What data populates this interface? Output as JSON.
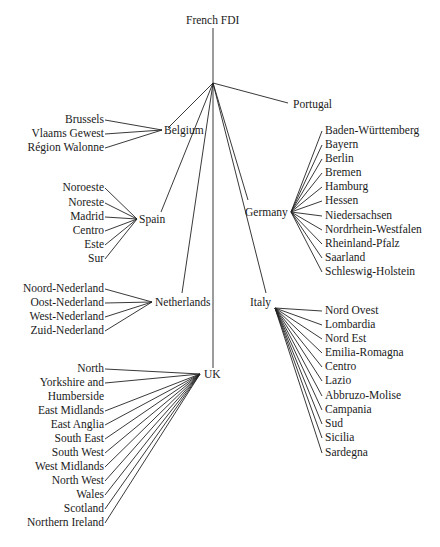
{
  "root": {
    "label": "French FDI",
    "x": 213,
    "y": 20
  },
  "hub": {
    "x": 213,
    "y": 83
  },
  "countries": [
    {
      "label": "Belgium",
      "x": 162,
      "y": 130,
      "anchor": "left",
      "tx": 164,
      "ty": 124,
      "regions_side": "left",
      "regions": [
        {
          "label": "Brussels",
          "x": 105,
          "y": 120
        },
        {
          "label": "Vlaams Gewest",
          "x": 105,
          "y": 134
        },
        {
          "label": "Région Walonne",
          "x": 105,
          "y": 148
        }
      ]
    },
    {
      "label": "Spain",
      "x": 137,
      "y": 219,
      "anchor": "left",
      "tx": 139,
      "ty": 213,
      "regions_side": "left",
      "regions": [
        {
          "label": "Noroeste",
          "x": 105,
          "y": 188
        },
        {
          "label": "Noreste",
          "x": 105,
          "y": 203
        },
        {
          "label": "Madrid",
          "x": 105,
          "y": 217
        },
        {
          "label": "Centro",
          "x": 105,
          "y": 231
        },
        {
          "label": "Este",
          "x": 105,
          "y": 245
        },
        {
          "label": "Sur",
          "x": 105,
          "y": 259
        }
      ]
    },
    {
      "label": "Netherlands",
      "x": 152,
      "y": 302,
      "anchor": "left",
      "tx": 155,
      "ty": 296,
      "regions_side": "left",
      "regions": [
        {
          "label": "Noord-Nederland",
          "x": 105,
          "y": 289
        },
        {
          "label": "Oost-Nederland",
          "x": 105,
          "y": 303
        },
        {
          "label": "West-Nederland",
          "x": 105,
          "y": 317
        },
        {
          "label": "Zuid-Nederland",
          "x": 105,
          "y": 331
        }
      ]
    },
    {
      "label": "UK",
      "x": 200,
      "y": 374,
      "anchor": "left",
      "tx": 204,
      "ty": 368,
      "regions_side": "left",
      "regions": [
        {
          "label": "North",
          "x": 105,
          "y": 369
        },
        {
          "label": "Yorkshire and",
          "x": 105,
          "y": 383
        },
        {
          "label": "Humberside",
          "x": null,
          "y": 397
        },
        {
          "label": "East Midlands",
          "x": 105,
          "y": 411
        },
        {
          "label": "East Anglia",
          "x": 105,
          "y": 425
        },
        {
          "label": "South East",
          "x": 105,
          "y": 439
        },
        {
          "label": "South West",
          "x": 105,
          "y": 453
        },
        {
          "label": "West Midlands",
          "x": 105,
          "y": 467
        },
        {
          "label": "North West",
          "x": 105,
          "y": 481
        },
        {
          "label": "Wales",
          "x": 105,
          "y": 495
        },
        {
          "label": "Scotland",
          "x": 105,
          "y": 509
        },
        {
          "label": "Northern Ireland",
          "x": 105,
          "y": 523
        }
      ]
    },
    {
      "label": "Italy",
      "x": 275,
      "y": 308,
      "anchor": "right",
      "tx": 250,
      "ty": 296,
      "regions_side": "right",
      "regions": [
        {
          "label": "Nord Ovest",
          "x": 322,
          "y": 311
        },
        {
          "label": "Lombardia",
          "x": 322,
          "y": 325
        },
        {
          "label": "Nord Est",
          "x": 322,
          "y": 339
        },
        {
          "label": "Emilia-Romagna",
          "x": 322,
          "y": 353
        },
        {
          "label": "Centro",
          "x": 322,
          "y": 367
        },
        {
          "label": "Lazio",
          "x": 322,
          "y": 381
        },
        {
          "label": "Abbruzo-Molise",
          "x": 322,
          "y": 396
        },
        {
          "label": "Campania",
          "x": 322,
          "y": 410
        },
        {
          "label": "Sud",
          "x": 322,
          "y": 424
        },
        {
          "label": "Sicilia",
          "x": 322,
          "y": 438
        },
        {
          "label": "Sardegna",
          "x": 322,
          "y": 453
        }
      ]
    },
    {
      "label": "Germany",
      "x": 291,
      "y": 212,
      "anchor": "right",
      "tx": 245,
      "ty": 206,
      "regions_side": "right",
      "regions": [
        {
          "label": "Baden-Württemberg",
          "x": 322,
          "y": 131
        },
        {
          "label": "Bayern",
          "x": 322,
          "y": 145
        },
        {
          "label": "Berlin",
          "x": 322,
          "y": 159
        },
        {
          "label": "Bremen",
          "x": 322,
          "y": 173
        },
        {
          "label": "Hamburg",
          "x": 322,
          "y": 187
        },
        {
          "label": "Hessen",
          "x": 322,
          "y": 201
        },
        {
          "label": "Niedersachsen",
          "x": 322,
          "y": 216
        },
        {
          "label": "Nordrhein-Westfalen",
          "x": 322,
          "y": 230
        },
        {
          "label": "Rheinland-Pfalz",
          "x": 322,
          "y": 244
        },
        {
          "label": "Saarland",
          "x": 322,
          "y": 258
        },
        {
          "label": "Schleswig-Holstein",
          "x": 322,
          "y": 272
        }
      ]
    },
    {
      "label": "Portugal",
      "x": 290,
      "y": 105,
      "anchor": "left",
      "tx": 293,
      "ty": 98,
      "regions_side": "none",
      "regions": []
    }
  ],
  "hub_edges": [
    [
      213,
      83,
      168,
      128
    ],
    [
      213,
      83,
      161,
      212
    ],
    [
      213,
      83,
      182,
      293
    ],
    [
      213,
      83,
      213,
      368
    ],
    [
      213,
      83,
      266,
      293
    ],
    [
      213,
      83,
      248,
      200
    ],
    [
      213,
      83,
      288,
      103
    ]
  ]
}
